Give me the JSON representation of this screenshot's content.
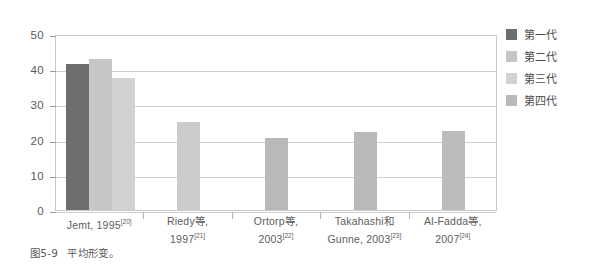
{
  "figure": {
    "caption_number": "图5-9",
    "caption_text": "平均形变。"
  },
  "legend": {
    "position": "right",
    "items": [
      {
        "label": "第一代",
        "color": "#6e6e6e"
      },
      {
        "label": "第二代",
        "color": "#c6c6c6"
      },
      {
        "label": "第三代",
        "color": "#d2d2d2"
      },
      {
        "label": "第四代",
        "color": "#b9b9b9"
      }
    ]
  },
  "chart_data": {
    "type": "bar",
    "title": "",
    "xlabel": "",
    "ylabel": "",
    "ylim": [
      0,
      50
    ],
    "yticks": [
      "0",
      "10",
      "20",
      "30",
      "40",
      "50"
    ],
    "ytick_values": [
      0,
      10,
      20,
      30,
      40,
      50
    ],
    "grid": true,
    "legend_position": "right",
    "categories": [
      "Jemt, 1995[20]",
      "Riedy等, 1997[21]",
      "Ortorp等, 2003[22]",
      "Takahashi和 Gunne, 2003[23]",
      "Al-Fadda等, 2007[24]"
    ],
    "category_labels": [
      {
        "line1": "Jemt, 1995",
        "ref1": "[20]",
        "line2": "",
        "ref2": ""
      },
      {
        "line1": "Riedy等,",
        "ref1": "",
        "line2": "1997",
        "ref2": "[21]"
      },
      {
        "line1": "Ortorp等,",
        "ref1": "",
        "line2": "2003",
        "ref2": "[22]"
      },
      {
        "line1": "Takahashi和",
        "ref1": "",
        "line2": "Gunne, 2003",
        "ref2": "[23]"
      },
      {
        "line1": "Al-Fadda等,",
        "ref1": "",
        "line2": "2007",
        "ref2": "[24]"
      }
    ],
    "series": [
      {
        "name": "第一代",
        "color": "#6e6e6e",
        "values": [
          41.5,
          null,
          null,
          null,
          null
        ]
      },
      {
        "name": "第二代",
        "color": "#c6c6c6",
        "values": [
          43.0,
          null,
          null,
          null,
          null
        ]
      },
      {
        "name": "第三代",
        "color": "#d2d2d2",
        "values": [
          37.5,
          25.0,
          null,
          null,
          null
        ]
      },
      {
        "name": "第四代",
        "color": "#b9b9b9",
        "values": [
          null,
          null,
          20.5,
          22.3,
          22.5
        ]
      }
    ],
    "bars": [
      {
        "category": 0,
        "series": "第一代",
        "value": 41.5,
        "color": "#6e6e6e"
      },
      {
        "category": 0,
        "series": "第二代",
        "value": 43.0,
        "color": "#c6c6c6"
      },
      {
        "category": 0,
        "series": "第三代",
        "value": 37.5,
        "color": "#d2d2d2"
      },
      {
        "category": 1,
        "series": "第三代",
        "value": 25.0,
        "color": "#cccccc"
      },
      {
        "category": 2,
        "series": "第四代",
        "value": 20.5,
        "color": "#b9b9b9"
      },
      {
        "category": 3,
        "series": "第四代",
        "value": 22.3,
        "color": "#b9b9b9"
      },
      {
        "category": 4,
        "series": "第四代",
        "value": 22.5,
        "color": "#bcbcbc"
      }
    ]
  }
}
